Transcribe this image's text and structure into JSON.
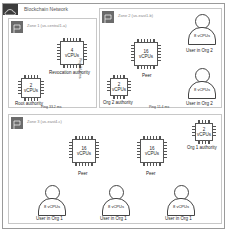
{
  "network": {
    "title": "Blockchain Network",
    "icon": "cloud-icon"
  },
  "zones": [
    {
      "title": "Zone 1 (us-central1-a)",
      "icon": "flag-icon"
    },
    {
      "title": "Zone 2 (us-east1-b)",
      "icon": "flag-icon"
    },
    {
      "title": "Zone 3 (us-east4-c)",
      "icon": "flag-icon"
    }
  ],
  "zone1": {
    "revocation": {
      "cpu": "4",
      "unit": "vCPUs",
      "label": "Revocation authority"
    },
    "root": {
      "cpu": "2",
      "unit": "vCPUs",
      "label": "Root authority"
    }
  },
  "zone2": {
    "peer": {
      "cpu": "16",
      "unit": "vCPUs",
      "label": "Peer"
    },
    "org2auth": {
      "cpu": "2",
      "unit": "vCPUs",
      "label": "Org 2 authority"
    },
    "users": [
      {
        "cpu": "8 vCPUs",
        "label": "User in Org 2"
      },
      {
        "cpu": "8 vCPUs",
        "label": "User in Org 2"
      }
    ]
  },
  "zone3": {
    "peers": [
      {
        "cpu": "16",
        "unit": "vCPUs",
        "label": "Peer"
      },
      {
        "cpu": "16",
        "unit": "vCPUs",
        "label": "Peer"
      }
    ],
    "org1auth": {
      "cpu": "2",
      "unit": "vCPUs",
      "label": "Org 1 authority"
    },
    "users": [
      {
        "cpu": "8 vCPUs",
        "label": "User in Org 1"
      },
      {
        "cpu": "8 vCPUs",
        "label": "User in Org 1"
      },
      {
        "cpu": "8 vCPUs",
        "label": "User in Org 1"
      }
    ]
  },
  "pings": {
    "z1_z3": "Ping 33.2 ms",
    "z2_z3": "Ping 11.4 ms",
    "z1_z2": "Ping 34.3 ms"
  }
}
